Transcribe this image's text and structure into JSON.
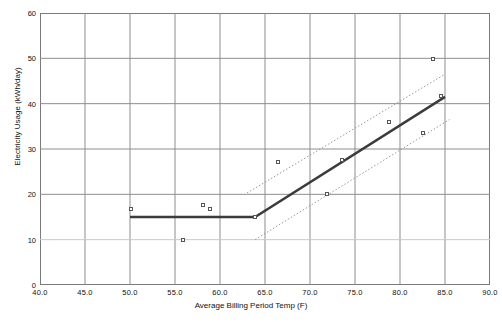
{
  "chart_data": {
    "type": "scatter",
    "title": "",
    "xlabel": "Average Billing Period Temp (F)",
    "ylabel": "Electricity Usage (kWh/day)",
    "xlim": [
      40.0,
      90.0
    ],
    "ylim": [
      0,
      60
    ],
    "xticks": [
      "40.0",
      "45.0",
      "50.0",
      "55.0",
      "60.0",
      "65.0",
      "70.0",
      "75.0",
      "80.0",
      "85.0",
      "90.0"
    ],
    "xtick_values": [
      40,
      45,
      50,
      55,
      60,
      65,
      70,
      75,
      80,
      85,
      90
    ],
    "yticks": [
      "0",
      "10",
      "20",
      "30",
      "40",
      "50",
      "60"
    ],
    "ytick_values": [
      0,
      10,
      20,
      30,
      40,
      50,
      60
    ],
    "grid": "both",
    "legend": "none",
    "marker_style": "open-square",
    "points": [
      {
        "x": 50.1,
        "y": 16.8
      },
      {
        "x": 55.9,
        "y": 9.9
      },
      {
        "x": 58.1,
        "y": 17.6
      },
      {
        "x": 58.9,
        "y": 16.8
      },
      {
        "x": 63.9,
        "y": 15.0
      },
      {
        "x": 66.4,
        "y": 27.1
      },
      {
        "x": 71.9,
        "y": 20.1
      },
      {
        "x": 73.6,
        "y": 27.6
      },
      {
        "x": 78.8,
        "y": 36.0
      },
      {
        "x": 82.6,
        "y": 33.5
      },
      {
        "x": 83.7,
        "y": 49.9
      },
      {
        "x": 84.6,
        "y": 41.7
      }
    ],
    "series": [
      {
        "name": "change-point-fit",
        "style": "solid-thick",
        "color": "#3b3b3b",
        "points": [
          {
            "x": 50.0,
            "y": 15.0
          },
          {
            "x": 63.9,
            "y": 15.0
          },
          {
            "x": 85.0,
            "y": 41.5
          }
        ]
      },
      {
        "name": "upper-confidence-band",
        "style": "dotted",
        "color": "#9a9a9a",
        "points": [
          {
            "x": 63.0,
            "y": 20.3
          },
          {
            "x": 85.0,
            "y": 46.5
          }
        ]
      },
      {
        "name": "lower-confidence-band",
        "style": "dotted",
        "color": "#9a9a9a",
        "points": [
          {
            "x": 63.9,
            "y": 10.0
          },
          {
            "x": 85.5,
            "y": 36.5
          }
        ]
      }
    ],
    "changepoint": {
      "x": 63.9,
      "y": 15.0
    },
    "baseline_level": 15.0
  }
}
